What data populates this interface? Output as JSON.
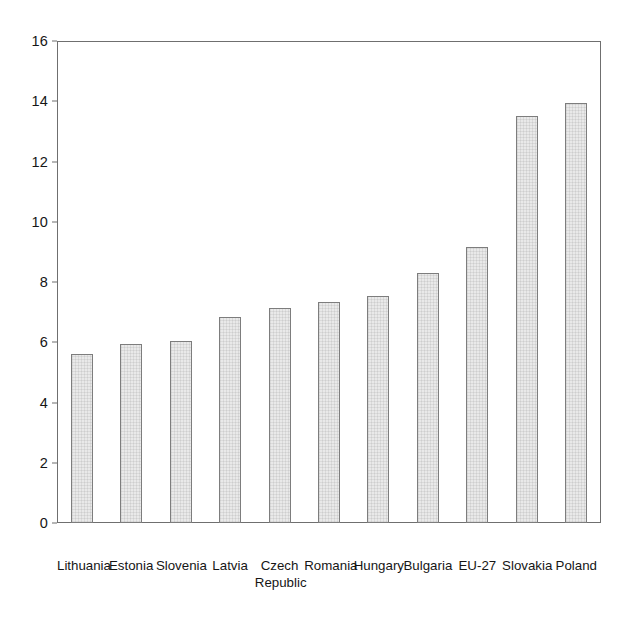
{
  "chart_data": {
    "type": "bar",
    "title": "",
    "subtitle": "",
    "xlabel": "",
    "ylabel": "",
    "categories": [
      "Lithuania",
      "Estonia",
      "Slovenia",
      "Latvia",
      "Czech\nRepublic",
      "Romania",
      "Hungary",
      "Bulgaria",
      "EU-27",
      "Slovakia",
      "Poland"
    ],
    "values": [
      5.6,
      5.95,
      6.05,
      6.85,
      7.15,
      7.35,
      7.55,
      8.3,
      9.15,
      13.5,
      13.95
    ],
    "ylim": [
      0,
      16
    ],
    "ytick_values": [
      0,
      2,
      4,
      6,
      8,
      10,
      12,
      14,
      16
    ],
    "ytick_labels": [
      "0",
      "2",
      "4",
      "6",
      "8",
      "10",
      "12",
      "14",
      "16"
    ],
    "grid": false,
    "legend": false,
    "legend_position": "none",
    "annotations": [],
    "colors": {
      "bar_fill": "#e9e9e9",
      "bar_border": "#7d7d7d",
      "frame": "#6f6f6f",
      "text": "#161616",
      "background": "#ffffff"
    }
  }
}
